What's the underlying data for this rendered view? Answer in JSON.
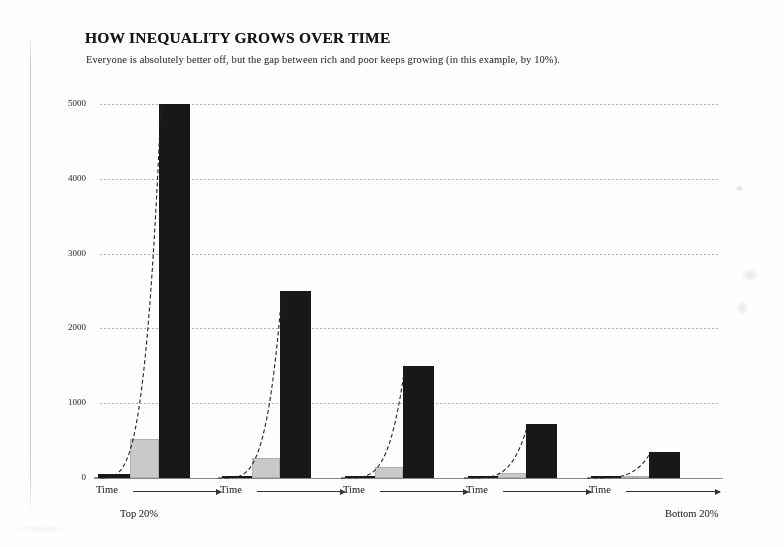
{
  "title": "HOW INEQUALITY GROWS OVER TIME",
  "subtitle": "Everyone is absolutely better off, but the gap between rich and poor keeps growing (in this example, by 10%).",
  "axis": {
    "y_ticks": [
      "5000",
      "4000",
      "3000",
      "2000",
      "1000",
      "0"
    ],
    "x_label": "Time"
  },
  "captions": {
    "left": "Top 20%",
    "right": "Bottom 20%"
  },
  "chart_data": {
    "type": "bar",
    "title": "HOW INEQUALITY GROWS OVER TIME",
    "subtitle": "Everyone is absolutely better off, but the gap between rich and poor keeps growing (in this example, by 10%).",
    "xlabel": "Time",
    "ylabel": "",
    "ylim": [
      0,
      5200
    ],
    "ytick_values": [
      0,
      1000,
      2000,
      3000,
      4000,
      5000
    ],
    "grid": true,
    "legend": "none",
    "categories": [
      "Top 20%",
      "2nd quintile",
      "3rd quintile",
      "4th quintile",
      "Bottom 20%"
    ],
    "series": [
      {
        "name": "Start",
        "color": "#151515",
        "values": [
          50,
          28,
          18,
          10,
          5
        ]
      },
      {
        "name": "Middle",
        "color": "#c9c9c9",
        "values": [
          520,
          270,
          150,
          70,
          30
        ]
      },
      {
        "name": "End",
        "color": "#151515",
        "values": [
          5000,
          2500,
          1500,
          720,
          350
        ]
      }
    ],
    "annotations": [
      "Each quintile grows exponentially at 10% over time",
      "Dashed curve traces exponential growth path within each quintile"
    ]
  }
}
